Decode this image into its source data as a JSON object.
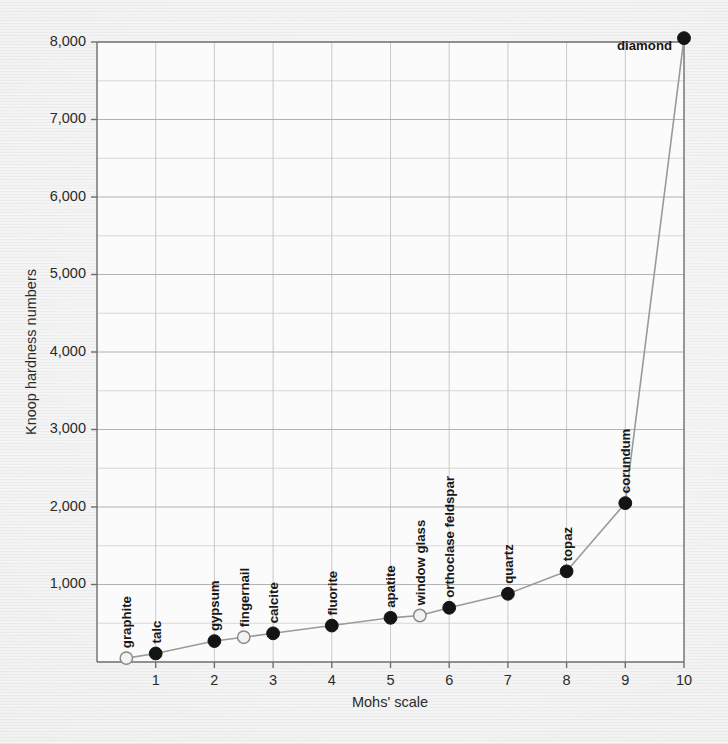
{
  "figure": {
    "background_color": "#ededed",
    "plot_background_color": "#fbfbfb",
    "line_color": "#9a9a9a",
    "marker_filled_color": "#141414",
    "marker_open_color": "#f2f2f2"
  },
  "chart_data": {
    "type": "line",
    "title": "",
    "xlabel": "Mohs' scale",
    "ylabel": "Knoop hardness numbers",
    "xlim": [
      0,
      10
    ],
    "ylim": [
      0,
      8000
    ],
    "xticks": [
      1,
      2,
      3,
      4,
      5,
      6,
      7,
      8,
      9,
      10
    ],
    "xtick_labels": [
      "1",
      "2",
      "3",
      "4",
      "5",
      "6",
      "7",
      "8",
      "9",
      "10"
    ],
    "yticks": [
      1000,
      2000,
      3000,
      4000,
      5000,
      6000,
      7000,
      8000
    ],
    "ytick_labels": [
      "1,000",
      "2,000",
      "3,000",
      "4,000",
      "5,000",
      "6,000",
      "7,000",
      "8,000"
    ],
    "grid": true,
    "legend": "none",
    "series": [
      {
        "name": "Knoop hardness vs Mohs' scale",
        "x": [
          0.5,
          1,
          2,
          2.5,
          3,
          4,
          5,
          5.5,
          6,
          7,
          8,
          9,
          10
        ],
        "values": [
          50,
          110,
          270,
          320,
          370,
          470,
          570,
          600,
          700,
          880,
          1170,
          2050,
          8050
        ]
      }
    ],
    "points": [
      {
        "label": "graphite",
        "x": 0.5,
        "y": 50,
        "marker": "open",
        "label_angle": -90,
        "label_anchor": "start"
      },
      {
        "label": "talc",
        "x": 1,
        "y": 110,
        "marker": "filled",
        "label_angle": -90,
        "label_anchor": "start"
      },
      {
        "label": "gypsum",
        "x": 2,
        "y": 270,
        "marker": "filled",
        "label_angle": -90,
        "label_anchor": "start"
      },
      {
        "label": "fingernail",
        "x": 2.5,
        "y": 320,
        "marker": "open",
        "label_angle": -90,
        "label_anchor": "start"
      },
      {
        "label": "calcite",
        "x": 3,
        "y": 370,
        "marker": "filled",
        "label_angle": -90,
        "label_anchor": "start"
      },
      {
        "label": "fluorite",
        "x": 4,
        "y": 470,
        "marker": "filled",
        "label_angle": -90,
        "label_anchor": "start"
      },
      {
        "label": "apatite",
        "x": 5,
        "y": 570,
        "marker": "filled",
        "label_angle": -90,
        "label_anchor": "start"
      },
      {
        "label": "window glass",
        "x": 5.5,
        "y": 600,
        "marker": "open",
        "label_angle": -90,
        "label_anchor": "start"
      },
      {
        "label": "orthoclase feldspar",
        "x": 6,
        "y": 700,
        "marker": "filled",
        "label_angle": -90,
        "label_anchor": "start"
      },
      {
        "label": "quartz",
        "x": 7,
        "y": 880,
        "marker": "filled",
        "label_angle": -90,
        "label_anchor": "start"
      },
      {
        "label": "topaz",
        "x": 8,
        "y": 1170,
        "marker": "filled",
        "label_angle": -90,
        "label_anchor": "start"
      },
      {
        "label": "corundum",
        "x": 9,
        "y": 2050,
        "marker": "filled",
        "label_angle": -90,
        "label_anchor": "start"
      },
      {
        "label": "diamond",
        "x": 10,
        "y": 8050,
        "marker": "filled",
        "label_angle": 0,
        "label_anchor": "end"
      }
    ]
  }
}
